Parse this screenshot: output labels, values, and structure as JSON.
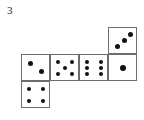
{
  "figure": {
    "label": "3",
    "stroke_color": "#6e6e6e",
    "pip_color": "#111111",
    "face_color": "#ffffff"
  },
  "dice": [
    {
      "name": "die-top-right",
      "value": 3,
      "pips": [
        "d3-a",
        "d3-b",
        "d3-c"
      ],
      "style": "diagonal",
      "x": 108,
      "y": 27
    },
    {
      "name": "die-middle-1",
      "value": 2,
      "pips": [
        "d2-a",
        "d2-b"
      ],
      "style": "diagonal",
      "x": 21,
      "y": 54
    },
    {
      "name": "die-middle-2",
      "value": 5,
      "pips": [
        "c-tl",
        "c-tr",
        "c-mc",
        "c-bl",
        "c-br"
      ],
      "style": "standard",
      "x": 50,
      "y": 54
    },
    {
      "name": "die-middle-3",
      "value": 6,
      "pips": [
        "c-tl",
        "c-tr",
        "c-ml",
        "c-mr",
        "c-bl",
        "c-br"
      ],
      "style": "standard",
      "x": 79,
      "y": 54
    },
    {
      "name": "die-middle-4",
      "value": 1,
      "pips": [
        "d1-c"
      ],
      "style": "standard",
      "x": 108,
      "y": 54
    },
    {
      "name": "die-bottom-left",
      "value": 4,
      "pips": [
        "c-tl",
        "c-tr",
        "c-bl",
        "c-br"
      ],
      "style": "standard",
      "x": 21,
      "y": 81
    }
  ]
}
